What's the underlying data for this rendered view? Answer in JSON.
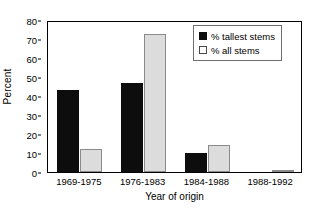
{
  "chart_data": {
    "type": "bar",
    "title": "",
    "xlabel": "Year of origin",
    "ylabel": "Percent",
    "categories": [
      "1969-1975",
      "1976-1983",
      "1984-1988",
      "1988-1992"
    ],
    "series": [
      {
        "name": "% tallest stems",
        "color": "#0d0d0d",
        "values": [
          43,
          47,
          10,
          0
        ]
      },
      {
        "name": "% all stems",
        "color": "#dcdcdc",
        "values": [
          12,
          72.5,
          14,
          1
        ]
      }
    ],
    "ylim": [
      0,
      80
    ],
    "yticks": [
      0,
      10,
      20,
      30,
      40,
      50,
      60,
      70,
      80
    ],
    "ytick_labels": [
      "0",
      "10",
      "20",
      "30",
      "40",
      "50",
      "60",
      "70",
      "80"
    ],
    "grid": false,
    "legend_position": "top-right"
  },
  "legend": {
    "entries": [
      {
        "label": "% tallest stems",
        "swatch": "filled-black-square"
      },
      {
        "label": "% all stems",
        "swatch": "outlined-white-square"
      }
    ]
  }
}
